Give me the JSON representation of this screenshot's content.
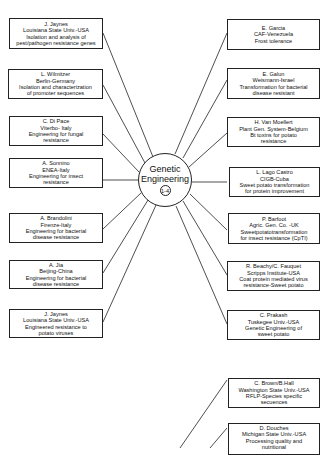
{
  "hub": {
    "line1": "Genetic",
    "line2": "Engineering",
    "number": "1-4"
  },
  "left_boxes": [
    {
      "lines": [
        "J. Jaynes",
        "Louisiana State Univ.-USA",
        "Isolation and analysis of",
        "pest/pathogen resistance genes"
      ]
    },
    {
      "lines": [
        "L. Wilmitzer",
        "Berlin-Germany",
        "Isolation and characterization",
        "of promoter sequences"
      ]
    },
    {
      "lines": [
        "C. Di Pace",
        "Viterbo- Italy",
        "Engineering for fungal",
        "resistance"
      ]
    },
    {
      "lines": [
        "A. Sonnino",
        "ENEA-Italy",
        "Engineering for insect",
        "resistance"
      ]
    },
    {
      "lines": [
        "A. Brandolini",
        "Firenze-Italy",
        "Engineering for bacterial",
        "disease resistance"
      ]
    },
    {
      "lines": [
        "A. Jia",
        "Beijing-China",
        "Engineering for bacterial",
        "disease resistance"
      ]
    },
    {
      "lines": [
        "J. Jaynes",
        "Louisiana State Univ.-USA",
        "Engineered resistance to",
        "potato viruses"
      ]
    }
  ],
  "right_boxes": [
    {
      "lines": [
        "E. Garcia",
        "CAF-Venezuela",
        "Frost tolerance"
      ]
    },
    {
      "lines": [
        "E. Galun",
        "Weismann-Israel",
        "Transformation for bacterial",
        "disease resistant"
      ]
    },
    {
      "lines": [
        "H. Van Moellert",
        "Plant Gen. System-Belgium",
        "Bt toxins for potato",
        "resistance"
      ]
    },
    {
      "lines": [
        "L. Lago Castro",
        "CIGB-Cuba",
        "Sweet potato transformation",
        "for protein improvement"
      ]
    },
    {
      "lines": [
        "P. Barfoot",
        "Agric. Gen. Co. -UK",
        "Sweetpotatotransformation",
        "for insect resistance (CpTI)"
      ]
    },
    {
      "lines": [
        "R. Beachy/C. Fauquet",
        "Scripps Institute-USA",
        "Coat protein mediated virus",
        "resistance-Sweet potato"
      ]
    },
    {
      "lines": [
        "C. Prakash",
        "Tuskegee Univ.-USA",
        "Genetic Engineering of",
        "sweet potato"
      ]
    },
    {
      "lines": [
        "C. Brown/B.Hall",
        "Washington State Univ.-USA",
        "RFLP-Species specific",
        "secuences"
      ]
    },
    {
      "lines": [
        "D. Douches",
        "Michigan State Univ.-USA",
        "Processing quality and",
        "nutritional"
      ]
    }
  ]
}
